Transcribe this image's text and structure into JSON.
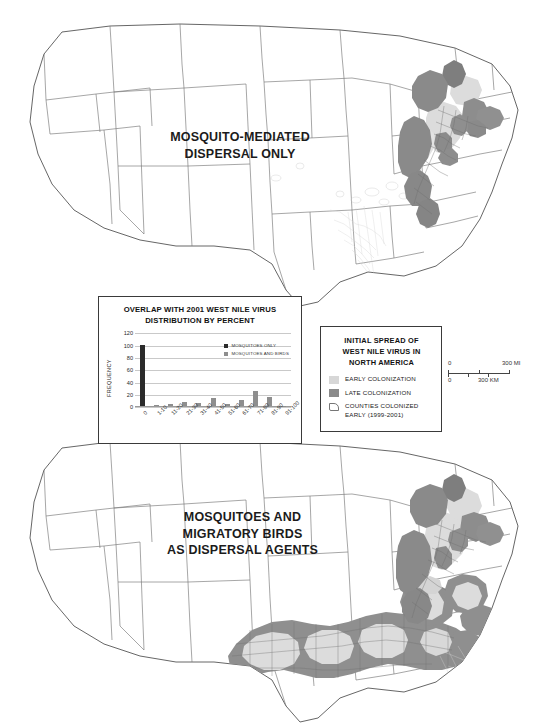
{
  "figure": {
    "panels": {
      "top": {
        "name": "mosquito-mediated-dispersal-map",
        "label_lines": [
          "MOSQUITO-MEDIATED",
          "DISPERSAL ONLY"
        ]
      },
      "bottom": {
        "name": "mosquitoes-and-birds-dispersal-map",
        "label_lines": [
          "MOSQUITOES AND",
          "MIGRATORY BIRDS",
          "AS DISPERSAL AGENTS"
        ]
      }
    }
  },
  "map_legend": {
    "title_lines": [
      "INITIAL SPREAD OF",
      "WEST NILE VIRUS IN",
      "NORTH AMERICA"
    ],
    "entries": [
      {
        "label_lines": [
          "EARLY COLONIZATION"
        ],
        "swatch": "early",
        "color": "#d7d7d7"
      },
      {
        "label_lines": [
          "LATE COLONIZATION"
        ],
        "swatch": "late",
        "color": "#8a8a8a"
      },
      {
        "label_lines": [
          "COUNTIES COLONIZED",
          "EARLY (1999-2001)"
        ],
        "swatch": "county",
        "color": "#ffffff"
      }
    ]
  },
  "scalebar": {
    "miles_start": "0",
    "miles_end": "300 MI",
    "km_start": "0",
    "km_end": "300 KM"
  },
  "chart_data": {
    "type": "bar",
    "title": "OVERLAP WITH 2001 WEST NILE VIRUS DISTRIBUTION BY PERCENT",
    "title_lines": [
      "OVERLAP WITH 2001 WEST NILE VIRUS",
      "DISTRIBUTION BY PERCENT"
    ],
    "xlabel": "",
    "ylabel": "FREQUENCY",
    "ylim": [
      0,
      120
    ],
    "yticks": [
      0,
      20,
      40,
      60,
      80,
      100,
      120
    ],
    "grid": true,
    "legend_position": "top-right",
    "categories": [
      "0",
      "1-10",
      "11-20",
      "21-30",
      "31-40",
      "41-50",
      "51-60",
      "61-70",
      "71-80",
      "81-90",
      "91-100"
    ],
    "series": [
      {
        "name": "MOSQUITOES ONLY",
        "color": "#2b2b2b",
        "values": [
          99,
          0,
          0,
          0,
          0,
          0,
          0,
          0,
          0,
          0,
          0
        ]
      },
      {
        "name": "MOSQUITOES AND BIRDS",
        "color": "#8e8e8e",
        "values": [
          0,
          2,
          4,
          7,
          6,
          13,
          4,
          11,
          25,
          15,
          1
        ]
      }
    ]
  }
}
